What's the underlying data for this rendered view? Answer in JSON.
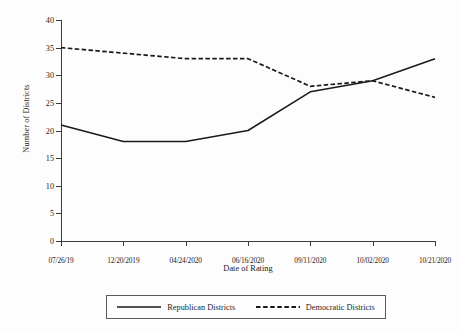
{
  "chart_data": {
    "type": "line",
    "title": "",
    "xlabel": "Date of Rating",
    "ylabel": "Number of Districts",
    "categories": [
      "07/26/19",
      "12/20/2019",
      "04/24/2020",
      "06/16/2020",
      "09/11/2020",
      "10/02/2020",
      "10/21/2020"
    ],
    "series": [
      {
        "name": "Republican Districts",
        "style": "solid",
        "color": "#1a1a1a",
        "values": [
          21,
          18,
          18,
          20,
          27,
          29,
          33
        ]
      },
      {
        "name": "Democratic Districts",
        "style": "dashed",
        "color": "#1a1a1a",
        "values": [
          35,
          34,
          33,
          33,
          28,
          29,
          26
        ]
      }
    ],
    "ylim": [
      0,
      40
    ],
    "yticks": [
      0,
      5,
      10,
      15,
      20,
      25,
      30,
      35,
      40
    ],
    "ytick_labels": [
      "0",
      "5",
      "10",
      "15",
      "20",
      "25",
      "30",
      "35",
      "40"
    ],
    "grid": false,
    "legend_position": "bottom"
  },
  "axes": {
    "y_title": "Number of Districts",
    "x_title": "Date of Rating"
  },
  "legend": {
    "entries": [
      {
        "label": "Republican Districts",
        "style": "solid"
      },
      {
        "label": "Democratic Districts",
        "style": "dashed"
      }
    ]
  },
  "colors": {
    "background": "#fdfdfd",
    "axis": "#3a3a3a",
    "series": "#1a1a1a"
  }
}
